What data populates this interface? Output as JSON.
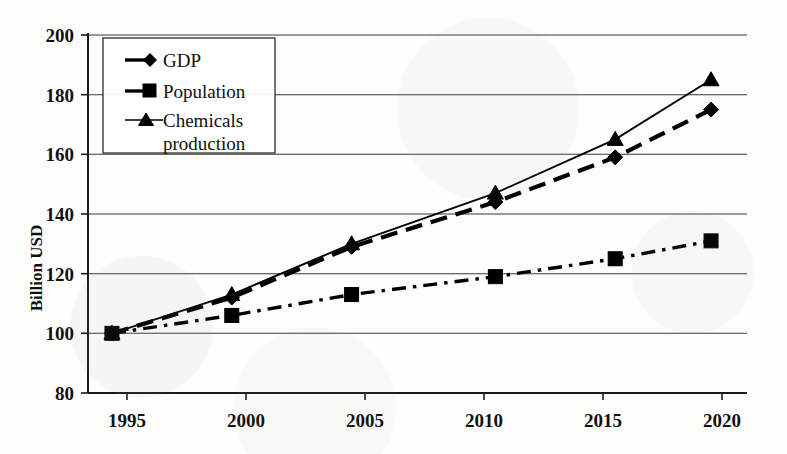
{
  "chart_data": {
    "type": "line",
    "title": "",
    "xlabel": "",
    "ylabel": "Billion USD",
    "x": [
      1995,
      2000,
      2005,
      2011,
      2016,
      2020
    ],
    "xtick_labels": [
      "1995",
      "2000",
      "2005",
      "2010",
      "2015",
      "2020"
    ],
    "xticks": [
      1995,
      2000,
      2005,
      2010,
      2015,
      2020
    ],
    "xlim": [
      1994,
      2021.5
    ],
    "ylim": [
      80,
      200
    ],
    "yticks": [
      80,
      100,
      120,
      140,
      160,
      180,
      200
    ],
    "ytick_labels": [
      "80",
      "100",
      "120",
      "140",
      "160",
      "180",
      "200"
    ],
    "grid": true,
    "legend_position": "upper-left-inside",
    "series": [
      {
        "name": "GDP",
        "marker": "diamond",
        "linestyle": "dashed",
        "color": "#000000",
        "values": [
          100,
          112,
          129,
          144,
          159,
          175
        ]
      },
      {
        "name": "Population",
        "marker": "square",
        "linestyle": "dash-dot",
        "color": "#000000",
        "values": [
          100,
          106,
          113,
          119,
          125,
          131
        ]
      },
      {
        "name": "Chemicals production",
        "marker": "triangle",
        "linestyle": "solid",
        "color": "#000000",
        "values": [
          100,
          113,
          130,
          147,
          165,
          185
        ]
      }
    ]
  },
  "legend": {
    "entries": [
      {
        "label": "GDP"
      },
      {
        "label": "Population"
      },
      {
        "label": "Chemicals"
      },
      {
        "label": "production"
      }
    ]
  },
  "axis": {
    "y_title": "Billion USD"
  }
}
